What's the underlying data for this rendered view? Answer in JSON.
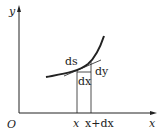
{
  "diagram": {
    "labels": {
      "y_axis": "y",
      "x_axis": "x",
      "origin": "O",
      "ds": "ds",
      "dy": "dy",
      "dx": "dx",
      "tick_x": "x",
      "tick_x_dx": "x+dx"
    },
    "colors": {
      "stroke": "#222222",
      "background": "#ffffff"
    }
  }
}
